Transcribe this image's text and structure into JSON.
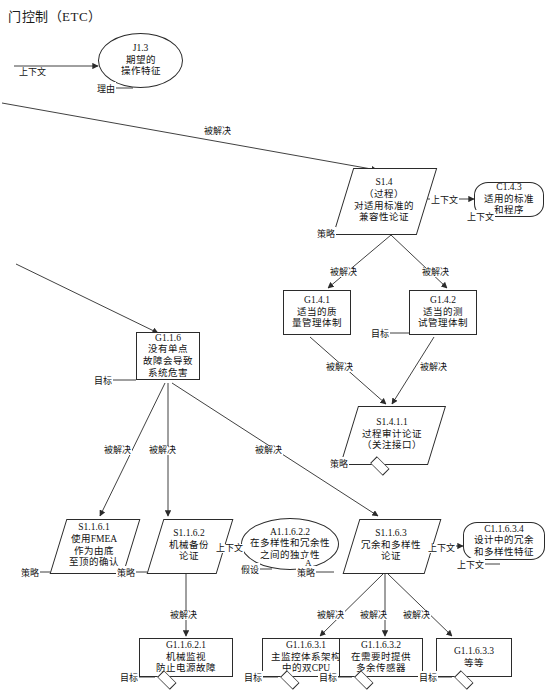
{
  "diagram": {
    "title": "门控制（ETC）",
    "type": "gsn-safety-case",
    "edge_label_solvedby": "被解决",
    "edge_label_context": "上下文",
    "nodes": [
      {
        "key": "j13",
        "id": "J1.3",
        "lines": [
          "期望的",
          "操作特征"
        ],
        "shape": "ellipse",
        "marker": "理由"
      },
      {
        "key": "s14",
        "id": "S1.4",
        "lines": [
          "（过程）",
          "对适用标准的",
          "兼容性论证"
        ],
        "shape": "strategy",
        "marker": "策略"
      },
      {
        "key": "c143",
        "id": "C1.4.3",
        "lines": [
          "适用的标准",
          "和程序"
        ],
        "shape": "context",
        "marker": "上下文"
      },
      {
        "key": "g141",
        "id": "G1.4.1",
        "lines": [
          "适当的质",
          "量管理体制"
        ],
        "shape": "goal",
        "marker": "目标"
      },
      {
        "key": "g142",
        "id": "G1.4.2",
        "lines": [
          "适当的测",
          "试管理体制"
        ],
        "shape": "goal",
        "marker": "目标"
      },
      {
        "key": "s1411",
        "id": "S1.4.1.1",
        "lines": [
          "过程审计论证",
          "（关注接口）"
        ],
        "shape": "strategy",
        "marker": "策略",
        "undeveloped": true
      },
      {
        "key": "g116",
        "id": "G1.1.6",
        "lines": [
          "没有单点",
          "故障会导致",
          "系统危害"
        ],
        "shape": "goal",
        "marker": "目标"
      },
      {
        "key": "s1161",
        "id": "S1.1.6.1",
        "lines": [
          "使用FMEA",
          "作为由底",
          "至顶的确认"
        ],
        "shape": "strategy",
        "marker": "策略"
      },
      {
        "key": "s1162",
        "id": "S1.1.6.2",
        "lines": [
          "机械备份",
          "论证"
        ],
        "shape": "strategy",
        "marker": "策略"
      },
      {
        "key": "a11622",
        "id": "A1.1.6.2.2",
        "lines": [
          "在多样性和冗余性",
          "之间的独立性"
        ],
        "shape": "ellipse",
        "marker": "假设",
        "badge": "A"
      },
      {
        "key": "s1163",
        "id": "S1.1.6.3",
        "lines": [
          "冗余和多样性",
          "论证"
        ],
        "shape": "strategy",
        "marker": "策略"
      },
      {
        "key": "c11634",
        "id": "C1.1.6.3.4",
        "lines": [
          "设计中的冗余",
          "和多样性特征"
        ],
        "shape": "context",
        "marker": "上下文"
      },
      {
        "key": "g11621",
        "id": "G1.1.6.2.1",
        "lines": [
          "机械监视",
          "防止电源故障"
        ],
        "shape": "goal",
        "marker": "目标",
        "undeveloped": true
      },
      {
        "key": "g11631",
        "id": "G1.1.6.3.1",
        "lines": [
          "主监控体系架构",
          "中的双CPU"
        ],
        "shape": "goal",
        "marker": "目标",
        "undeveloped": true
      },
      {
        "key": "g11632",
        "id": "G1.1.6.3.2",
        "lines": [
          "在需要时提供",
          "多余传感器"
        ],
        "shape": "goal",
        "marker": "目标",
        "undeveloped": true
      },
      {
        "key": "g11633",
        "id": "G1.1.6.3.3",
        "lines": [
          "等等"
        ],
        "shape": "goal",
        "marker": "目标",
        "undeveloped": true
      }
    ],
    "edges": [
      {
        "from": "offpage-left-top",
        "to": "j13",
        "label": "上下文"
      },
      {
        "from": "offpage-left-1",
        "to": "s14",
        "label": "被解决"
      },
      {
        "from": "s14",
        "to": "c143",
        "label": "上下文"
      },
      {
        "from": "s14",
        "to": "g141",
        "label": "被解决"
      },
      {
        "from": "s14",
        "to": "g142",
        "label": "被解决"
      },
      {
        "from": "g141",
        "to": "s1411",
        "label": "被解决"
      },
      {
        "from": "g142",
        "to": "s1411",
        "label": "被解决"
      },
      {
        "from": "offpage-left-2",
        "to": "g116",
        "label": ""
      },
      {
        "from": "g116",
        "to": "s1161",
        "label": "被解决"
      },
      {
        "from": "g116",
        "to": "s1162",
        "label": "被解决"
      },
      {
        "from": "g116",
        "to": "s1163",
        "label": "被解决"
      },
      {
        "from": "s1162",
        "to": "a11622",
        "label": "上下文"
      },
      {
        "from": "s1163",
        "to": "c11634",
        "label": "上下文"
      },
      {
        "from": "s1162",
        "to": "g11621",
        "label": "被解决"
      },
      {
        "from": "s1163",
        "to": "g11631",
        "label": "被解决"
      },
      {
        "from": "s1163",
        "to": "g11632",
        "label": "被解决"
      },
      {
        "from": "s1163",
        "to": "g11633",
        "label": "被解决"
      }
    ],
    "labels": {
      "ctx_j13": "上下文",
      "sb_top": "被解决",
      "ctx_s14_c143": "上下文",
      "sb_g141": "被解决",
      "sb_g142": "被解决",
      "sb_s1411_a": "被解决",
      "sb_s1411_b": "被解决",
      "sb_s1161": "被解决",
      "sb_s1162": "被解决",
      "sb_s1163": "被解决",
      "ctx_a11622": "上下文",
      "ctx_c11634": "上下文",
      "sb_g11621": "被解决",
      "sb_g11631": "被解决",
      "sb_g11632": "被解决",
      "sb_g11633": "被解决"
    }
  }
}
